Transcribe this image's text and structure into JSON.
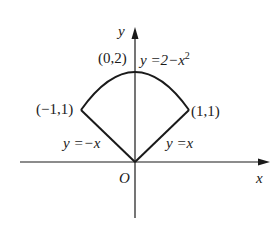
{
  "diagram": {
    "axes": {
      "x_label": "x",
      "y_label": "y",
      "origin_label": "O"
    },
    "points": [
      {
        "label": "(0,2)",
        "x": 0,
        "y": 2
      },
      {
        "label": "(−1,1)",
        "x": -1,
        "y": 1
      },
      {
        "label": "(1,1)",
        "x": 1,
        "y": 1
      }
    ],
    "curves": [
      {
        "label": "y =2−x",
        "exponent": "2",
        "equation": "y = 2 − x^2",
        "domain": [
          -1,
          1
        ]
      },
      {
        "label": "y =−x",
        "equation": "y = −x",
        "domain": [
          -1,
          0
        ]
      },
      {
        "label": "y =x",
        "equation": "y = x",
        "domain": [
          0,
          1
        ]
      }
    ],
    "colors": {
      "stroke": "#1a1a1a",
      "background": "#ffffff"
    }
  }
}
